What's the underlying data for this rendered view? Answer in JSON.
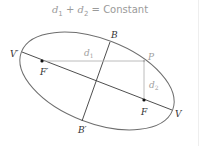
{
  "title": {
    "d1": "d",
    "d1_sub": "1",
    "plus": " + ",
    "d2": "d",
    "d2_sub": "2",
    "equals_text": " = Constant"
  },
  "labels": {
    "V_prime": "V′",
    "V": "V",
    "F_prime": "F′",
    "F": "F",
    "B": "B",
    "B_prime": "B′",
    "P": "P",
    "d1": "d",
    "d1_sub": "1",
    "d2": "d",
    "d2_sub": "2"
  },
  "colors": {
    "ellipse": "#6e6e6e",
    "axes": "#3a3a3a",
    "distance_lines": "#b4b4b4",
    "title_text": "#9a9a9a",
    "label_dark": "#333333",
    "label_light": "#a0a0a0"
  }
}
